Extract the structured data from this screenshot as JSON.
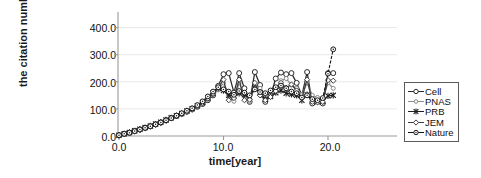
{
  "chart_data": {
    "type": "line",
    "title": "",
    "xlabel": "time[year]",
    "ylabel": "the citation number",
    "xlim": [
      -1.0,
      24.5
    ],
    "ylim": [
      0,
      430
    ],
    "xticks": [
      "0.0",
      "10.0",
      "20.0"
    ],
    "xtick_values": [
      0,
      10,
      20
    ],
    "yticks": [
      "0.0",
      "100.0",
      "200.0",
      "300.0",
      "400.0"
    ],
    "ytick_values": [
      0,
      100,
      200,
      300,
      400
    ],
    "grid": "horizontal",
    "legend_position": "right-outside",
    "x": [
      0,
      0.5,
      1,
      1.5,
      2,
      2.5,
      3,
      3.5,
      4,
      4.5,
      5,
      5.5,
      6,
      6.5,
      7,
      7.5,
      8,
      8.5,
      9,
      9.5,
      10,
      10.5,
      11,
      11.5,
      12,
      12.5,
      13,
      13.5,
      14,
      14.5,
      15,
      15.5,
      16,
      16.5,
      17,
      17.5,
      18,
      18.5,
      19,
      19.5,
      20,
      20.5
    ],
    "series": [
      {
        "name": "Cell",
        "marker": "open-circle",
        "line": "solid",
        "color": "#2b2b2b",
        "values": [
          3,
          8,
          12,
          18,
          24,
          30,
          36,
          43,
          50,
          58,
          66,
          74,
          82,
          90,
          98,
          108,
          118,
          132,
          150,
          185,
          228,
          232,
          160,
          232,
          176,
          126,
          236,
          188,
          126,
          150,
          212,
          234,
          228,
          232,
          196,
          150,
          236,
          120,
          128,
          120,
          232,
          232
        ]
      },
      {
        "name": "PNAS",
        "marker": "open-circle-small",
        "line": "solid",
        "color": "#8a8a8a",
        "values": [
          3,
          7,
          11,
          16,
          22,
          28,
          34,
          41,
          48,
          56,
          64,
          72,
          80,
          88,
          97,
          107,
          120,
          136,
          152,
          170,
          196,
          150,
          128,
          196,
          150,
          128,
          180,
          176,
          150,
          166,
          174,
          204,
          212,
          188,
          176,
          152,
          196,
          150,
          142,
          136,
          196,
          176
        ]
      },
      {
        "name": "PRB",
        "marker": "star",
        "line": "solid",
        "color": "#1f1f1f",
        "values": [
          3,
          8,
          13,
          19,
          25,
          31,
          37,
          44,
          51,
          59,
          67,
          75,
          83,
          92,
          101,
          112,
          124,
          140,
          158,
          176,
          168,
          150,
          148,
          158,
          152,
          144,
          176,
          160,
          136,
          146,
          160,
          168,
          158,
          154,
          150,
          132,
          152,
          130,
          126,
          128,
          148,
          150
        ]
      },
      {
        "name": "JEM",
        "marker": "open-diamond",
        "line": "solid",
        "color": "#3d3d3d",
        "values": [
          3,
          7,
          12,
          17,
          23,
          29,
          35,
          42,
          49,
          57,
          65,
          73,
          81,
          89,
          98,
          109,
          122,
          138,
          156,
          178,
          208,
          132,
          140,
          208,
          132,
          134,
          196,
          150,
          132,
          144,
          166,
          196,
          178,
          190,
          168,
          140,
          208,
          126,
          124,
          126,
          206,
          204
        ]
      },
      {
        "name": "Nature",
        "marker": "open-circle-dot",
        "line": "dashed",
        "color": "#151515",
        "values": [
          3,
          8,
          12,
          18,
          24,
          30,
          36,
          43,
          50,
          58,
          66,
          75,
          84,
          93,
          102,
          114,
          128,
          146,
          164,
          180,
          172,
          164,
          152,
          166,
          160,
          150,
          172,
          162,
          158,
          168,
          180,
          186,
          176,
          164,
          158,
          142,
          150,
          136,
          132,
          140,
          230,
          320
        ]
      }
    ]
  },
  "axes": {
    "ylabel": "the citation number",
    "xlabel": "time[year]",
    "ytick_labels": [
      "400.0",
      "300.0",
      "200.0",
      "100.0",
      "0.0"
    ],
    "xtick_labels": [
      "0.0",
      "10.0",
      "20.0"
    ]
  },
  "legend": {
    "items": [
      {
        "label": "Cell",
        "marker": "open-circle"
      },
      {
        "label": "PNAS",
        "marker": "open-circle-small"
      },
      {
        "label": "PRB",
        "marker": "star"
      },
      {
        "label": "JEM",
        "marker": "open-diamond"
      },
      {
        "label": "Nature",
        "marker": "open-circle-dot"
      }
    ]
  },
  "colors": {
    "axis": "#9a9a9a",
    "grid": "#e8e8e8",
    "text": "#111111",
    "legend_border": "#5a5a5a"
  }
}
